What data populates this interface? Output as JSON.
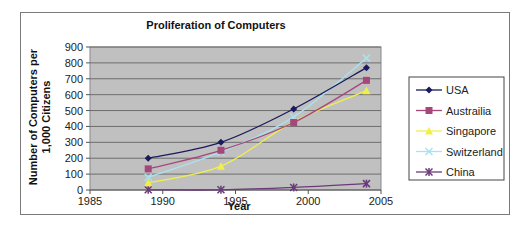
{
  "chart_data": {
    "type": "line",
    "title": "Proliferation of Computers",
    "xlabel": "Year",
    "ylabel_lines": [
      "Number of Computers per",
      "1,000 Citizens"
    ],
    "ylabel": "Number of Computers per 1,000 Citizens",
    "xlim": [
      1985,
      2005
    ],
    "ylim": [
      0,
      900
    ],
    "xticks": [
      1985,
      1990,
      1995,
      2000,
      2005
    ],
    "yticks": [
      0,
      100,
      200,
      300,
      400,
      500,
      600,
      700,
      800,
      900
    ],
    "grid": true,
    "legend_position": "right",
    "plot_background": "#c0c0c0",
    "x": [
      1989,
      1994,
      1999,
      2004
    ],
    "series": [
      {
        "name": "USA",
        "color": "#1a1a5e",
        "marker": "diamond",
        "values": [
          200,
          300,
          510,
          770
        ]
      },
      {
        "name": "Austrailia",
        "color": "#a8467a",
        "marker": "square",
        "values": [
          133,
          250,
          425,
          690
        ]
      },
      {
        "name": "Singapore",
        "color": "#f0f04a",
        "marker": "triangle",
        "values": [
          45,
          150,
          430,
          625
        ]
      },
      {
        "name": "Switzerland",
        "color": "#a9e2f0",
        "marker": "x",
        "values": [
          80,
          240,
          460,
          830
        ]
      },
      {
        "name": "China",
        "color": "#6a3a7a",
        "marker": "star",
        "values": [
          1,
          1,
          16,
          40
        ]
      }
    ]
  }
}
